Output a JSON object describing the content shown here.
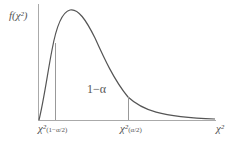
{
  "diagram": {
    "y_axis_label": "f(χ²)",
    "x_axis_label": "χ²",
    "area_label": "1−α",
    "critical_left": {
      "symbol": "χ²",
      "subscript": "(1−α/2)"
    },
    "critical_right": {
      "symbol": "χ²",
      "subscript": "(α/2)"
    },
    "colors": {
      "curve": "#555555",
      "axis": "#999999",
      "lines": "#999999",
      "text": "#555555"
    }
  }
}
